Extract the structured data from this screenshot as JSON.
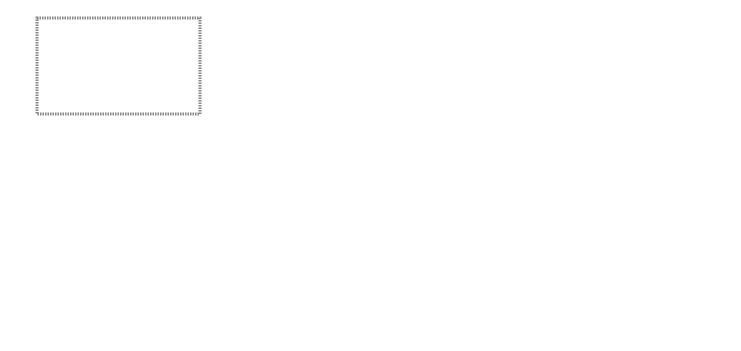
{
  "diagram": {
    "outer_group": {
      "operational": {
        "line1": "Operational Plane",
        "line2": "(application)"
      },
      "foundational": {
        "line1": "Foundational Plane",
        "line2": "(platform)"
      }
    },
    "planes": {
      "monitoring": "Monitoring Plane",
      "adaptation": "Adaptation Plane",
      "configuration": "Configuration Plane",
      "certification": {
        "line1": "Certification",
        "line2": "Assurance Plane"
      }
    },
    "model": {
      "title": "Model",
      "items": [
        {
          "line1": "Parametrized",
          "line2": "architecture"
        },
        {
          "line1": "Reconfiguration",
          "line2": "transitions"
        },
        {
          "line1": "Properties",
          "line2": ""
        }
      ]
    },
    "analysis_tools": {
      "line1": "Analysis",
      "line2": "tools"
    },
    "engineer": "Engineer",
    "edges": {
      "is_used_by": "is used by",
      "specifies": "specifies",
      "represents": "represents"
    }
  }
}
